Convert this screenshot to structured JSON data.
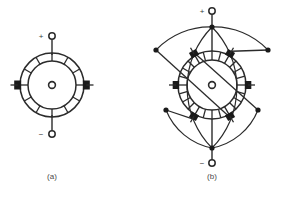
{
  "figure": {
    "background_color": "#ffffff",
    "stroke_color": "#2b2b2b",
    "fill_black": "#1a1a1a",
    "caption_color": "#4a4a4a",
    "panels": [
      {
        "key": "a",
        "caption": "(a)",
        "caption_x": 52,
        "caption_y": 179,
        "center_x": 52,
        "center_y": 85,
        "ring_outer_r": 32,
        "ring_inner_r": 24,
        "hub_r": 3.4,
        "segments": 12,
        "segment_gap_deg": 4.5,
        "brush_count": 2,
        "brush_angles_deg": [
          90,
          270
        ],
        "terminals": [
          {
            "name": "positive",
            "sign": "+",
            "sign_x": 41,
            "sign_y": 39,
            "node_x": 52,
            "node_y": 36,
            "node_r": 3.2
          },
          {
            "name": "negative",
            "sign": "−",
            "sign_x": 41,
            "sign_y": 137,
            "node_x": 52,
            "node_y": 134,
            "node_r": 3.2
          }
        ]
      },
      {
        "key": "b",
        "caption": "(b)",
        "caption_x": 212,
        "caption_y": 179,
        "center_x": 212,
        "center_y": 85,
        "ring_outer_r": 34,
        "ring_inner_r": 25,
        "hub_r": 3.4,
        "segments": 24,
        "segment_gap_deg": 3.0,
        "brush_count": 6,
        "brush_angles_deg": [
          90,
          150,
          210,
          270,
          330,
          30
        ],
        "terminals": [
          {
            "name": "positive",
            "sign": "+",
            "sign_x": 202,
            "sign_y": 14,
            "node_x": 212,
            "node_y": 11,
            "node_r": 3.2
          },
          {
            "name": "negative",
            "sign": "−",
            "sign_x": 202,
            "sign_y": 166,
            "node_x": 212,
            "node_y": 163,
            "node_r": 3.2
          }
        ],
        "bus_nodes": [
          {
            "name": "positive-bus-node",
            "x": 212,
            "y": 27,
            "r": 2.6
          },
          {
            "name": "negative-bus-node",
            "x": 212,
            "y": 148,
            "r": 2.6
          }
        ],
        "equalizer_dots": [
          {
            "name": "equalizer-dot-upper-left",
            "x": 156,
            "y": 50,
            "r": 2.6
          },
          {
            "name": "equalizer-dot-upper-right",
            "x": 268,
            "y": 50,
            "r": 2.6
          },
          {
            "name": "equalizer-dot-lower-left",
            "x": 166,
            "y": 110,
            "r": 2.6
          },
          {
            "name": "equalizer-dot-lower-right",
            "x": 258,
            "y": 110,
            "r": 2.6
          }
        ]
      }
    ]
  }
}
